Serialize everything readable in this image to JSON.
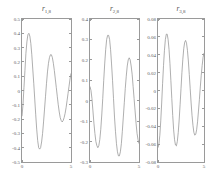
{
  "figure": {
    "background": "#ffffff",
    "line_color": "#8c8c8c",
    "axis_color": "#9a9a9a",
    "panel_count": 3
  },
  "chart_data": [
    {
      "type": "line",
      "title": "r_1,8",
      "title_base": "r",
      "title_sub": "1,8",
      "xlabel": "",
      "ylabel": "",
      "xlim": [
        0,
        5
      ],
      "ylim": [
        -0.5,
        0.5
      ],
      "xticks": [
        0,
        5
      ],
      "xticklabels": [
        "0",
        "5"
      ],
      "yticks": [
        0.5,
        0.4,
        0.3,
        0.2,
        0.1,
        0,
        -0.1,
        -0.2,
        -0.3,
        -0.4,
        -0.5
      ],
      "yticklabels": [
        "0.5",
        "0.4",
        "0.3",
        "0.2",
        "0.1",
        "0",
        "-0.1",
        "-0.2",
        "-0.3",
        "-0.4",
        "-0.5"
      ],
      "grid": false,
      "legend": null,
      "x": [
        0.0,
        0.1,
        0.2,
        0.3,
        0.4,
        0.5,
        0.6,
        0.7,
        0.8,
        0.9,
        1.0,
        1.1,
        1.2,
        1.3,
        1.4,
        1.5,
        1.6,
        1.7,
        1.8,
        1.9,
        2.0,
        2.1,
        2.2,
        2.3,
        2.4,
        2.5,
        2.6,
        2.7,
        2.8,
        2.9,
        3.0,
        3.1,
        3.2,
        3.3,
        3.4,
        3.5,
        3.6,
        3.7,
        3.8,
        3.9,
        4.0,
        4.1,
        4.2,
        4.3,
        4.4,
        4.5,
        4.6,
        4.7,
        4.8,
        4.9,
        5.0
      ],
      "y": [
        -0.18,
        -0.1,
        0.02,
        0.14,
        0.26,
        0.34,
        0.39,
        0.4,
        0.38,
        0.33,
        0.25,
        0.15,
        0.05,
        -0.06,
        -0.17,
        -0.27,
        -0.35,
        -0.4,
        -0.41,
        -0.4,
        -0.36,
        -0.3,
        -0.22,
        -0.13,
        -0.04,
        0.05,
        0.13,
        0.19,
        0.23,
        0.25,
        0.25,
        0.23,
        0.19,
        0.14,
        0.08,
        0.02,
        -0.04,
        -0.1,
        -0.15,
        -0.19,
        -0.21,
        -0.22,
        -0.21,
        -0.19,
        -0.16,
        -0.12,
        -0.07,
        -0.02,
        0.03,
        0.08,
        0.12
      ]
    },
    {
      "type": "line",
      "title": "r_2,8",
      "title_base": "r",
      "title_sub": "2,8",
      "xlabel": "",
      "ylabel": "",
      "xlim": [
        0,
        5
      ],
      "ylim": [
        -0.3,
        0.4
      ],
      "xticks": [
        0,
        5
      ],
      "xticklabels": [
        "0",
        "5"
      ],
      "yticks": [
        0.4,
        0.3,
        0.2,
        0.1,
        0,
        -0.1,
        -0.2,
        -0.3
      ],
      "yticklabels": [
        "0.4",
        "0.3",
        "0.2",
        "0.1",
        "0",
        "-0.1",
        "-0.2",
        "-0.3"
      ],
      "grid": false,
      "legend": null,
      "x": [
        0.0,
        0.1,
        0.2,
        0.3,
        0.4,
        0.5,
        0.6,
        0.7,
        0.8,
        0.9,
        1.0,
        1.1,
        1.2,
        1.3,
        1.4,
        1.5,
        1.6,
        1.7,
        1.8,
        1.9,
        2.0,
        2.1,
        2.2,
        2.3,
        2.4,
        2.5,
        2.6,
        2.7,
        2.8,
        2.9,
        3.0,
        3.1,
        3.2,
        3.3,
        3.4,
        3.5,
        3.6,
        3.7,
        3.8,
        3.9,
        4.0,
        4.1,
        4.2,
        4.3,
        4.4,
        4.5,
        4.6,
        4.7,
        4.8,
        4.9,
        5.0
      ],
      "y": [
        0.07,
        0.05,
        0.01,
        -0.05,
        -0.11,
        -0.16,
        -0.2,
        -0.22,
        -0.23,
        -0.22,
        -0.19,
        -0.14,
        -0.07,
        0.01,
        0.1,
        0.18,
        0.25,
        0.3,
        0.32,
        0.32,
        0.3,
        0.25,
        0.18,
        0.1,
        0.01,
        -0.08,
        -0.15,
        -0.21,
        -0.25,
        -0.27,
        -0.27,
        -0.25,
        -0.21,
        -0.15,
        -0.08,
        -0.01,
        0.06,
        0.12,
        0.17,
        0.2,
        0.21,
        0.2,
        0.17,
        0.13,
        0.07,
        0.01,
        -0.05,
        -0.11,
        -0.16,
        -0.19,
        -0.21
      ]
    },
    {
      "type": "line",
      "title": "r_3,8",
      "title_base": "r",
      "title_sub": "3,8",
      "xlabel": "",
      "ylabel": "",
      "xlim": [
        0,
        5
      ],
      "ylim": [
        -0.08,
        0.08
      ],
      "xticks": [
        0,
        5
      ],
      "xticklabels": [
        "0",
        "5"
      ],
      "yticks": [
        0.08,
        0.06,
        0.04,
        0.02,
        0,
        -0.02,
        -0.04,
        -0.06,
        -0.08
      ],
      "yticklabels": [
        "0.08",
        "0.06",
        "0.04",
        "0.02",
        "0",
        "-0.02",
        "-0.04",
        "-0.06",
        "-0.08"
      ],
      "grid": false,
      "legend": null,
      "x": [
        0.0,
        0.1,
        0.2,
        0.3,
        0.4,
        0.5,
        0.6,
        0.7,
        0.8,
        0.9,
        1.0,
        1.1,
        1.2,
        1.3,
        1.4,
        1.5,
        1.6,
        1.7,
        1.8,
        1.9,
        2.0,
        2.1,
        2.2,
        2.3,
        2.4,
        2.5,
        2.6,
        2.7,
        2.8,
        2.9,
        3.0,
        3.1,
        3.2,
        3.3,
        3.4,
        3.5,
        3.6,
        3.7,
        3.8,
        3.9,
        4.0,
        4.1,
        4.2,
        4.3,
        4.4,
        4.5,
        4.6,
        4.7,
        4.8,
        4.9,
        5.0
      ],
      "y": [
        -0.064,
        -0.06,
        -0.05,
        -0.034,
        -0.014,
        0.008,
        0.028,
        0.045,
        0.057,
        0.063,
        0.063,
        0.057,
        0.046,
        0.03,
        0.011,
        -0.009,
        -0.028,
        -0.044,
        -0.055,
        -0.061,
        -0.062,
        -0.057,
        -0.047,
        -0.033,
        -0.016,
        0.002,
        0.02,
        0.035,
        0.047,
        0.054,
        0.056,
        0.053,
        0.045,
        0.033,
        0.018,
        0.002,
        -0.014,
        -0.028,
        -0.039,
        -0.047,
        -0.05,
        -0.049,
        -0.044,
        -0.035,
        -0.023,
        -0.01,
        0.004,
        0.017,
        0.028,
        0.037,
        0.042
      ]
    }
  ]
}
